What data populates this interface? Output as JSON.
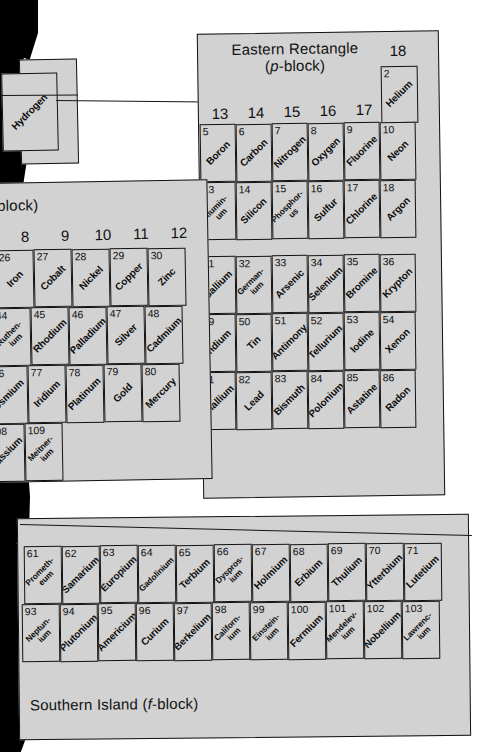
{
  "figure": {
    "kind": "periodic-table-fragment",
    "fill_color": "#d2d2d2",
    "line_color": "#121212",
    "background": "#ffffff"
  },
  "blocks": {
    "p_block": {
      "title_line1": "Eastern Rectangle",
      "title_line2_pre": "(",
      "title_line2_em": "p",
      "title_line2_post": "-block)",
      "group_18_label": "18",
      "group_labels": [
        "13",
        "14",
        "15",
        "16",
        "17"
      ]
    },
    "d_block": {
      "title_tail": "-block)",
      "group_labels": [
        "8",
        "9",
        "10",
        "11",
        "12"
      ]
    },
    "f_block": {
      "title_pre": "Southern Island (",
      "title_em": "f",
      "title_post": "-block)"
    },
    "s_block": {
      "hydrogen_name": "Hydrogen"
    }
  },
  "elements": {
    "helium": {
      "z": "2",
      "name": "Helium"
    },
    "p_row2": [
      {
        "z": "5",
        "name": "Boron"
      },
      {
        "z": "6",
        "name": "Carbon"
      },
      {
        "z": "7",
        "name": "Nitrogen"
      },
      {
        "z": "8",
        "name": "Oxygen"
      },
      {
        "z": "9",
        "name": "Fluorine"
      },
      {
        "z": "10",
        "name": "Neon"
      }
    ],
    "p_row3": [
      {
        "z": "13",
        "name": "Alumin-\num"
      },
      {
        "z": "14",
        "name": "Silicon"
      },
      {
        "z": "15",
        "name": "Phosphor-\nus"
      },
      {
        "z": "16",
        "name": "Sulfur"
      },
      {
        "z": "17",
        "name": "Chlorine"
      },
      {
        "z": "18",
        "name": "Argon"
      }
    ],
    "p_row4": [
      {
        "z": "31",
        "name": "Gallium"
      },
      {
        "z": "32",
        "name": "German-\nium"
      },
      {
        "z": "33",
        "name": "Arsenic"
      },
      {
        "z": "34",
        "name": "Selenium"
      },
      {
        "z": "35",
        "name": "Bromine"
      },
      {
        "z": "36",
        "name": "Krypton"
      }
    ],
    "p_row5": [
      {
        "z": "49",
        "name": "Indium"
      },
      {
        "z": "50",
        "name": "Tin"
      },
      {
        "z": "51",
        "name": "Antimony"
      },
      {
        "z": "52",
        "name": "Tellurium"
      },
      {
        "z": "53",
        "name": "Iodine"
      },
      {
        "z": "54",
        "name": "Xenon"
      }
    ],
    "p_row6": [
      {
        "z": "81",
        "name": "Thallium"
      },
      {
        "z": "82",
        "name": "Lead"
      },
      {
        "z": "83",
        "name": "Bismuth"
      },
      {
        "z": "84",
        "name": "Polonium"
      },
      {
        "z": "85",
        "name": "Astatine"
      },
      {
        "z": "86",
        "name": "Radon"
      }
    ],
    "d_row4": [
      {
        "z": "26",
        "name": "Iron"
      },
      {
        "z": "27",
        "name": "Cobalt"
      },
      {
        "z": "28",
        "name": "Nickel"
      },
      {
        "z": "29",
        "name": "Copper"
      },
      {
        "z": "30",
        "name": "Zinc"
      }
    ],
    "d_row5": [
      {
        "z": "44",
        "name": "Ruthen-\nium"
      },
      {
        "z": "45",
        "name": "Rhodium"
      },
      {
        "z": "46",
        "name": "Palladium"
      },
      {
        "z": "47",
        "name": "Silver"
      },
      {
        "z": "48",
        "name": "Cadmium"
      }
    ],
    "d_row6": [
      {
        "z": "76",
        "name": "Osmium"
      },
      {
        "z": "77",
        "name": "Iridium"
      },
      {
        "z": "78",
        "name": "Platinum"
      },
      {
        "z": "79",
        "name": "Gold"
      },
      {
        "z": "80",
        "name": "Mercury"
      }
    ],
    "d_row7": [
      {
        "z": "108",
        "name": "Hassium"
      },
      {
        "z": "109",
        "name": "Meitner-\nium"
      }
    ],
    "f_row6": [
      {
        "z": "61",
        "name": "Prometh-\neum"
      },
      {
        "z": "62",
        "name": "Samarium"
      },
      {
        "z": "63",
        "name": "Europium"
      },
      {
        "z": "64",
        "name": "Gadolinium"
      },
      {
        "z": "65",
        "name": "Terbium"
      },
      {
        "z": "66",
        "name": "Dyspros-\nium"
      },
      {
        "z": "67",
        "name": "Holmium"
      },
      {
        "z": "68",
        "name": "Erbium"
      },
      {
        "z": "69",
        "name": "Thulium"
      },
      {
        "z": "70",
        "name": "Ytterbium"
      },
      {
        "z": "71",
        "name": "Lutetium"
      }
    ],
    "f_row7": [
      {
        "z": "93",
        "name": "Neptun-\nium"
      },
      {
        "z": "94",
        "name": "Plutonium"
      },
      {
        "z": "95",
        "name": "Americium"
      },
      {
        "z": "96",
        "name": "Curium"
      },
      {
        "z": "97",
        "name": "Berkelium"
      },
      {
        "z": "98",
        "name": "Californ-\nium"
      },
      {
        "z": "99",
        "name": "Einstein-\nium"
      },
      {
        "z": "100",
        "name": "Fermium"
      },
      {
        "z": "101",
        "name": "Mendelev-\nium"
      },
      {
        "z": "102",
        "name": "Nobellium"
      },
      {
        "z": "103",
        "name": "Lawrenc-\nium"
      }
    ]
  }
}
